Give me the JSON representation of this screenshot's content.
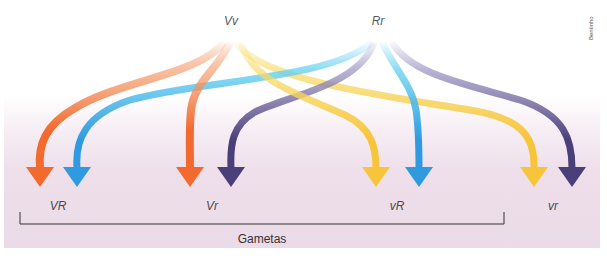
{
  "parents": [
    {
      "id": "vv",
      "label": "Vv",
      "x": 231
    },
    {
      "id": "rr",
      "label": "Rr",
      "x": 378
    }
  ],
  "gametes": [
    {
      "id": "VR",
      "label": "VR",
      "x": 58
    },
    {
      "id": "Vr",
      "label": "Vr",
      "x": 212
    },
    {
      "id": "vR",
      "label": "vR",
      "x": 397
    },
    {
      "id": "vr",
      "label": "vr",
      "x": 553
    }
  ],
  "bracket": {
    "title": "Gametas"
  },
  "credit": "Bentinho",
  "colors": {
    "orange": "#f26a2e",
    "yellow": "#f7c53a",
    "blue": "#2f9ae0",
    "purple": "#4b3f7a",
    "background_bottom": "#eadbe8"
  },
  "arrows": [
    {
      "from": "Vv",
      "to": "VR",
      "color": "orange"
    },
    {
      "from": "Rr",
      "to": "VR",
      "color": "blue"
    },
    {
      "from": "Vv",
      "to": "Vr",
      "color": "orange"
    },
    {
      "from": "Rr",
      "to": "Vr",
      "color": "purple"
    },
    {
      "from": "Vv",
      "to": "vR",
      "color": "yellow"
    },
    {
      "from": "Rr",
      "to": "vR",
      "color": "blue"
    },
    {
      "from": "Vv",
      "to": "vr",
      "color": "yellow"
    },
    {
      "from": "Rr",
      "to": "vr",
      "color": "purple"
    }
  ]
}
